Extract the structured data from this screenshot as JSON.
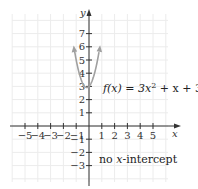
{
  "chart_data": {
    "type": "line",
    "title": "",
    "function_label": "f(x) = 3x² + x + 3",
    "function_parts": {
      "pre": "f(x) = 3x",
      "sup": "2",
      "post": " + x + 3"
    },
    "annotation": "no x-intercept",
    "annotation_parts": {
      "pre": "no ",
      "var": "x",
      "post": "-intercept"
    },
    "xlabel": "x",
    "ylabel": "y",
    "xlim": [
      -6,
      6
    ],
    "ylim": [
      -4,
      8.5
    ],
    "x_ticks": [
      -5,
      -4,
      -3,
      -2,
      -1,
      1,
      2,
      3,
      4,
      5
    ],
    "y_ticks": [
      -3,
      -2,
      -1,
      1,
      2,
      3,
      4,
      5,
      6,
      7
    ],
    "grid": true,
    "series": [
      {
        "name": "f(x) = 3x^2 + x + 3",
        "x": [
          -1.2,
          -1.0,
          -0.8,
          -0.6,
          -0.4,
          -0.2,
          -0.1667,
          0.0,
          0.2,
          0.4,
          0.6,
          0.8,
          1.0
        ],
        "y": [
          6.12,
          5.0,
          4.12,
          3.48,
          3.08,
          2.92,
          2.917,
          3.0,
          3.32,
          3.88,
          4.68,
          5.72,
          7.0
        ],
        "color": "#a0a0a0",
        "arrows": "both-ends"
      }
    ]
  },
  "colors": {
    "axis": "#333333",
    "grid": "#ececec",
    "curve": "#a0a0a0"
  }
}
